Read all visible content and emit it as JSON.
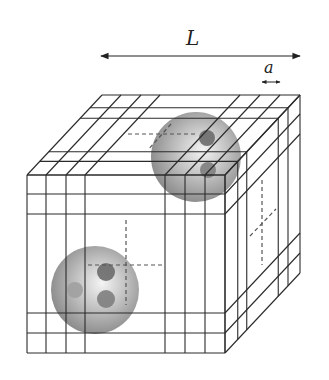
{
  "figure": {
    "labels": {
      "box_length": "L",
      "grid_spacing": "a"
    },
    "colors": {
      "line": "#2a2a2a",
      "sphere_light": "#f0f0f0",
      "sphere_mid": "#b8b8b8",
      "sphere_dark": "#858585",
      "patch_dark": "#6c6c6c",
      "patch_mid": "#7e7e7e",
      "patch_light": "#a0a0a0",
      "dash": "#555555"
    },
    "cube": {
      "front_x": [
        27,
        46,
        66,
        85,
        165,
        185,
        205,
        225
      ],
      "front_y": [
        175,
        194,
        214,
        313,
        333,
        353
      ],
      "depth_fractions": [
        0,
        0.17,
        0.29,
        0.71,
        0.84,
        1
      ],
      "depth_offset": {
        "dx": 75,
        "dy": -80
      }
    },
    "arrows": {
      "L": {
        "x1": 101,
        "x2": 300,
        "y": 56
      },
      "a": {
        "x1": 262,
        "x2": 280,
        "y": 82
      }
    },
    "spheres": [
      {
        "name": "upper-sphere",
        "cx": 196,
        "cy": 157,
        "r": 45,
        "patches": [
          {
            "cx": 207,
            "cy": 138,
            "r": 8,
            "tone": "dark"
          },
          {
            "cx": 208,
            "cy": 170,
            "r": 8,
            "tone": "mid"
          }
        ]
      },
      {
        "name": "lower-sphere",
        "cx": 95,
        "cy": 290,
        "r": 44,
        "patches": [
          {
            "cx": 106,
            "cy": 272,
            "r": 9,
            "tone": "dark"
          },
          {
            "cx": 106,
            "cy": 299,
            "r": 9,
            "tone": "mid"
          },
          {
            "cx": 75,
            "cy": 290,
            "r": 8,
            "tone": "light"
          }
        ]
      }
    ],
    "dashed_lines": [
      {
        "x1": 128,
        "y1": 134,
        "x2": 196,
        "y2": 134
      },
      {
        "x1": 171,
        "y1": 124,
        "x2": 148,
        "y2": 150
      },
      {
        "x1": 88,
        "y1": 265,
        "x2": 163,
        "y2": 265
      },
      {
        "x1": 126,
        "y1": 220,
        "x2": 126,
        "y2": 305
      },
      {
        "x1": 262,
        "y1": 180,
        "x2": 262,
        "y2": 265
      },
      {
        "x1": 250,
        "y1": 236,
        "x2": 276,
        "y2": 209
      }
    ]
  }
}
